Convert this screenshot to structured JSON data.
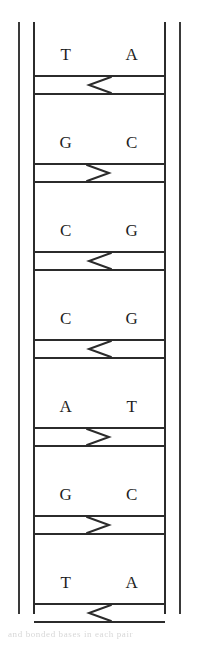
{
  "figure": {
    "caption_artifact": "and bonded bases in each pair",
    "ink_color": "#2b2b2b",
    "background_color": "#ffffff"
  },
  "ladder": {
    "rails": [
      {
        "name": "outer-left-rail",
        "x": 18
      },
      {
        "name": "inner-left-rail",
        "x": 33
      },
      {
        "name": "inner-right-rail",
        "x": 164
      },
      {
        "name": "outer-right-rail",
        "x": 179
      }
    ],
    "rungs": [
      {
        "index": 1,
        "left_base": "T",
        "right_base": "A",
        "arrow": "left",
        "arrow_glyph": "◀"
      },
      {
        "index": 2,
        "left_base": "G",
        "right_base": "C",
        "arrow": "right",
        "arrow_glyph": "▶"
      },
      {
        "index": 3,
        "left_base": "C",
        "right_base": "G",
        "arrow": "left",
        "arrow_glyph": "◀"
      },
      {
        "index": 4,
        "left_base": "C",
        "right_base": "G",
        "arrow": "left",
        "arrow_glyph": "◀"
      },
      {
        "index": 5,
        "left_base": "A",
        "right_base": "T",
        "arrow": "right",
        "arrow_glyph": "▶"
      },
      {
        "index": 6,
        "left_base": "G",
        "right_base": "C",
        "arrow": "right",
        "arrow_glyph": "▶"
      },
      {
        "index": 7,
        "left_base": "T",
        "right_base": "A",
        "arrow": "left",
        "arrow_glyph": "◀"
      }
    ]
  }
}
